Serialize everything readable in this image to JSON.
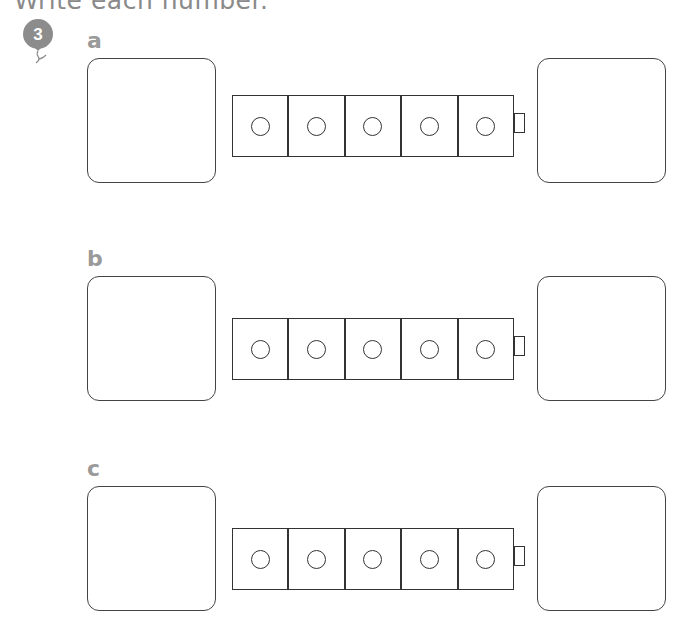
{
  "header": {
    "title": "Write each number.",
    "question_number": "3",
    "balloon_color": "#8c8c8c"
  },
  "rows": [
    {
      "label": "a",
      "cubes": 5,
      "top": 58,
      "train_top": 95
    },
    {
      "label": "b",
      "cubes": 5,
      "top": 276,
      "train_top": 318
    },
    {
      "label": "c",
      "cubes": 5,
      "top": 486,
      "train_top": 528
    }
  ],
  "colors": {
    "label_gray": "#9a9a9a",
    "line": "#333333"
  }
}
